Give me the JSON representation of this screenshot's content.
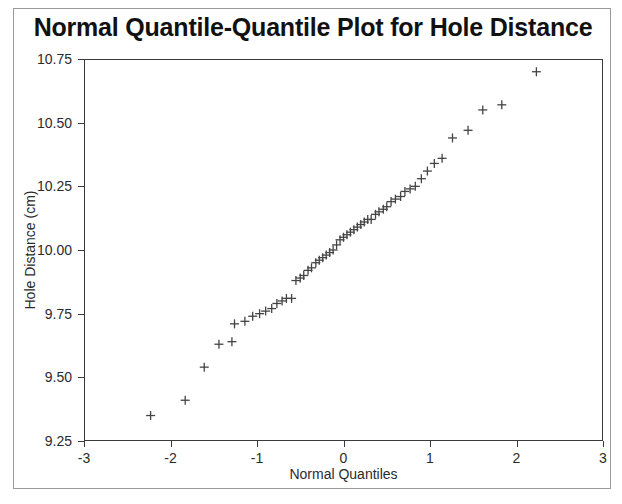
{
  "chart_data": {
    "type": "scatter",
    "title": "Normal Quantile-Quantile Plot for Hole Distance",
    "xlabel": "Normal Quantiles",
    "ylabel": "Hole Distance (cm)",
    "xlim": [
      -3,
      3
    ],
    "ylim": [
      9.25,
      10.75
    ],
    "xticks": [
      -3,
      -2,
      -1,
      0,
      1,
      2,
      3
    ],
    "xtick_labels": [
      "-3",
      "-2",
      "-1",
      "0",
      "1",
      "2",
      "3"
    ],
    "yticks": [
      9.25,
      9.5,
      9.75,
      10.0,
      10.25,
      10.5,
      10.75
    ],
    "ytick_labels": [
      "9.25",
      "9.50",
      "9.75",
      "10.00",
      "10.25",
      "10.50",
      "10.75"
    ],
    "grid": false,
    "legend": null,
    "marker": "plus",
    "marker_color": "#444444",
    "series": [
      {
        "name": "Hole Distance",
        "x": [
          -2.23,
          -1.83,
          -1.61,
          -1.44,
          -1.29,
          -1.26,
          -1.14,
          -1.05,
          -0.97,
          -0.9,
          -0.83,
          -0.77,
          -0.71,
          -0.66,
          -0.6,
          -0.55,
          -0.5,
          -0.46,
          -0.41,
          -0.37,
          -0.32,
          -0.28,
          -0.24,
          -0.2,
          -0.16,
          -0.12,
          -0.08,
          -0.04,
          0.0,
          0.04,
          0.08,
          0.12,
          0.16,
          0.2,
          0.24,
          0.28,
          0.32,
          0.37,
          0.41,
          0.46,
          0.5,
          0.55,
          0.6,
          0.66,
          0.71,
          0.77,
          0.83,
          0.9,
          0.97,
          1.05,
          1.14,
          1.26,
          1.44,
          1.61,
          1.83,
          2.23
        ],
        "y": [
          9.35,
          9.41,
          9.54,
          9.63,
          9.64,
          9.71,
          9.72,
          9.74,
          9.75,
          9.76,
          9.77,
          9.79,
          9.8,
          9.81,
          9.81,
          9.88,
          9.89,
          9.9,
          9.92,
          9.93,
          9.95,
          9.96,
          9.97,
          9.98,
          9.99,
          10.0,
          10.02,
          10.04,
          10.05,
          10.06,
          10.07,
          10.08,
          10.09,
          10.1,
          10.11,
          10.12,
          10.12,
          10.14,
          10.15,
          10.16,
          10.17,
          10.19,
          10.2,
          10.21,
          10.23,
          10.24,
          10.25,
          10.28,
          10.31,
          10.34,
          10.36,
          10.44,
          10.47,
          10.55,
          10.57,
          10.7
        ]
      }
    ]
  },
  "figure": {
    "background_color": "#ffffff",
    "frame_color": "#3a3a3a",
    "border_color": "#9a9a9a",
    "text_color": "#2b2b2b"
  }
}
